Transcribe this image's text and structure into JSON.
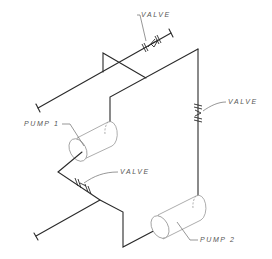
{
  "diagram": {
    "type": "isometric piping schematic",
    "labels": {
      "valve_top": "VALVE",
      "valve_right": "VALVE",
      "valve_bottom": "VALVE",
      "pump_1": "PUMP 1",
      "pump_2": "PUMP 2"
    },
    "colors": {
      "line": "#2a2a2a",
      "leader": "#6a6a6a",
      "label": "#555555",
      "background": "#ffffff"
    }
  }
}
